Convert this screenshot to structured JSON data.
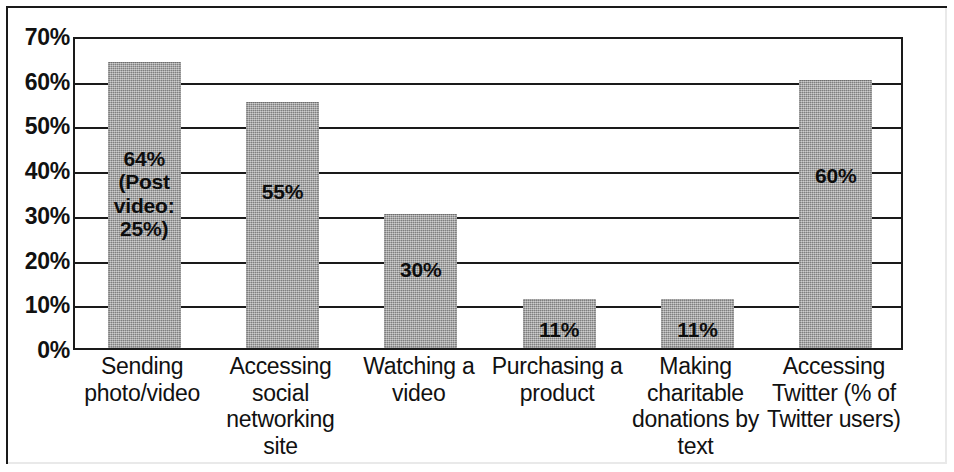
{
  "chart_data": {
    "type": "bar",
    "title": "",
    "subtitle": "",
    "xlabel": "",
    "ylabel": "",
    "ylim": [
      0,
      70
    ],
    "y_tick_labels": [
      "70%",
      "60%",
      "50%",
      "40%",
      "30%",
      "20%",
      "10%",
      "0%"
    ],
    "y_tick_values": [
      70,
      60,
      50,
      40,
      30,
      20,
      10,
      0
    ],
    "grid": true,
    "legend": "none",
    "bar_color": "#9d9d9d",
    "axis_color": "#1a1a1a",
    "categories": [
      "Sending\nphoto/video",
      "Accessing\nsocial\nnetworking site",
      "Watching a\nvideo",
      "Purchasing a\nproduct",
      "Making\ncharitable\ndonations by\ntext",
      "Accessing\nTwitter (% of\nTwitter users)"
    ],
    "values": [
      64,
      55,
      30,
      11,
      11,
      60
    ],
    "data_labels": [
      "64%\n(Post\nvideo:\n25%)",
      "55%",
      "30%",
      "11%",
      "11%",
      "60%"
    ],
    "annotations": [
      {
        "category": "Sending photo/video",
        "text": "Post video: 25%",
        "value": 25
      }
    ]
  }
}
